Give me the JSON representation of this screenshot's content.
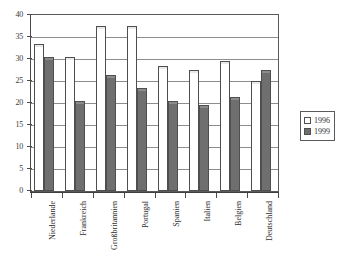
{
  "chart_data": {
    "type": "bar",
    "title": "",
    "subtitle": "",
    "xlabel": "",
    "ylabel": "",
    "ylim": [
      0,
      40
    ],
    "ytick_step": 5,
    "yticks": [
      "0",
      "5",
      "10",
      "15",
      "20",
      "25",
      "30",
      "35",
      "40"
    ],
    "grid": true,
    "legend_position": "right",
    "categories": [
      "Niederlande",
      "Frankreich",
      "Großbritannien",
      "Portugal",
      "Spanien",
      "Italien",
      "Belgien",
      "Deutschland"
    ],
    "series": [
      {
        "name": "1996",
        "color": "#ffffff",
        "values": [
          33,
          30,
          37,
          37,
          28,
          27,
          29,
          24.5
        ]
      },
      {
        "name": "1999",
        "color": "#6f6f6f",
        "values": [
          30,
          20,
          26,
          23,
          20,
          19,
          21,
          27
        ]
      }
    ]
  },
  "legend": {
    "entries": [
      {
        "label": "1996",
        "swatch": "white-square-swatch"
      },
      {
        "label": "1999",
        "swatch": "dark-square-swatch"
      }
    ]
  },
  "colors": {
    "series_1996": "#ffffff",
    "series_1999": "#6f6f6f",
    "axis": "#4a4a4a",
    "grid": "#8d8d8d",
    "background": "#ffffff"
  }
}
